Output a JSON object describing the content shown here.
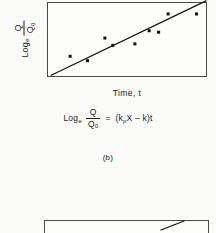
{
  "page": {
    "background_color": "#fbfbfa",
    "ink_color": "#1a1a1a"
  },
  "figure_b": {
    "caption": "(b)",
    "y_axis": {
      "log_label": "Log",
      "log_subscript": "e",
      "numerator": "Q",
      "denominator": "Q",
      "denominator_subscript": "0"
    },
    "x_axis": {
      "label": "Time, t"
    },
    "equation": {
      "log_label": "Log",
      "log_subscript": "e",
      "numerator": "Q",
      "denominator": "Q",
      "denominator_subscript": "0",
      "equals": "=",
      "rhs_open": "(k",
      "rhs_sub": "p",
      "rhs_rest": "X – k)t",
      "full_text": "Log_e Q/Q_0 = (k_p X - k)t"
    }
  },
  "chart_data": {
    "type": "scatter",
    "title": "",
    "xlabel": "Time, t",
    "ylabel": "Log_e Q/Q_0",
    "grid": false,
    "legend": null,
    "axis_ticks": {
      "x": [],
      "y": []
    },
    "xlim": [
      0,
      100
    ],
    "ylim": [
      0,
      100
    ],
    "points": [
      {
        "x": 14,
        "y": 27
      },
      {
        "x": 25,
        "y": 21
      },
      {
        "x": 36,
        "y": 52
      },
      {
        "x": 41,
        "y": 42
      },
      {
        "x": 64,
        "y": 62
      },
      {
        "x": 70,
        "y": 60
      },
      {
        "x": 76,
        "y": 85
      },
      {
        "x": 94,
        "y": 85
      },
      {
        "x": 55,
        "y": 44
      }
    ],
    "trend_line": {
      "type": "linear-fit",
      "start": {
        "x": 2,
        "y": 1
      },
      "end": {
        "x": 100,
        "y": 103
      },
      "description": "straight regression line rising from lower-left corner of frame and exiting through top-right"
    },
    "marker": {
      "shape": "filled-square-dot",
      "color": "#111111",
      "size_px": 3
    },
    "line_color": "#141414"
  },
  "next_panel": {
    "visible_fragment": "top edge of the following plot frame with a short diagonal line segment near its upper-right corner",
    "has_diagonal_segment": true
  }
}
